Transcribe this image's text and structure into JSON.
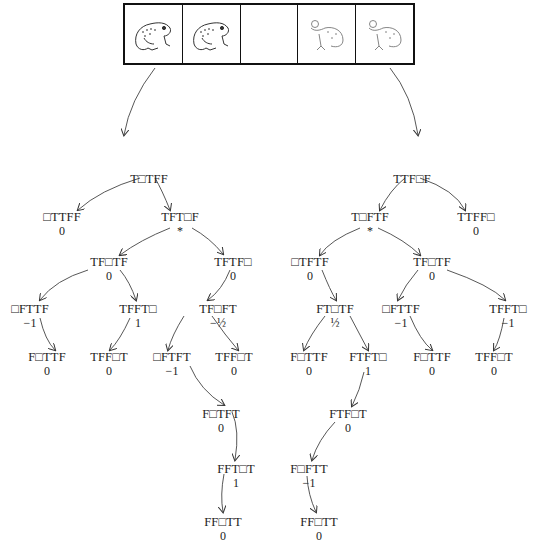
{
  "frames": {
    "cells": [
      {
        "content": "toad",
        "icon": "toad-icon"
      },
      {
        "content": "toad",
        "icon": "toad-icon"
      },
      {
        "content": "empty",
        "icon": ""
      },
      {
        "content": "frog",
        "icon": "frog-icon"
      },
      {
        "content": "frog",
        "icon": "frog-icon"
      }
    ]
  },
  "tree": {
    "nodes": {
      "n_l_root": {
        "label": "T□TFF",
        "value": ""
      },
      "n_l1": {
        "label": "□TTFF",
        "value": "0"
      },
      "n_l2": {
        "label": "TFT□F",
        "value": "*"
      },
      "n_l3": {
        "label": "TF□TF",
        "value": "0"
      },
      "n_l4": {
        "label": "TFTF□",
        "value": "0"
      },
      "n_l5": {
        "label": "□FTTF",
        "value": "−1"
      },
      "n_l6": {
        "label": "TFFT□",
        "value": "1"
      },
      "n_l7": {
        "label": "TF□FT",
        "value": "−½"
      },
      "n_l8": {
        "label": "F□TTF",
        "value": "0"
      },
      "n_l9": {
        "label": "TFF□T",
        "value": "0"
      },
      "n_l10": {
        "label": "□FTFT",
        "value": "−1"
      },
      "n_l11": {
        "label": "TFF□T",
        "value": "0"
      },
      "n_l12": {
        "label": "F□TFT",
        "value": "0"
      },
      "n_l13": {
        "label": "FFT□T",
        "value": "1"
      },
      "n_l14": {
        "label": "FF□TT",
        "value": "0"
      },
      "n_r_root": {
        "label": "TTF□F",
        "value": ""
      },
      "n_r1": {
        "label": "T□FTF",
        "value": "*"
      },
      "n_r2": {
        "label": "TTFF□",
        "value": "0"
      },
      "n_r3": {
        "label": "□TFTF",
        "value": "0"
      },
      "n_r4": {
        "label": "TF□TF",
        "value": "0"
      },
      "n_r5": {
        "label": "FT□TF",
        "value": "½"
      },
      "n_r6": {
        "label": "□FTTF",
        "value": "−1"
      },
      "n_r7": {
        "label": "TFFT□",
        "value": "−1"
      },
      "n_r8": {
        "label": "F□TTF",
        "value": "0"
      },
      "n_r9": {
        "label": "FTFT□",
        "value": "1"
      },
      "n_r10": {
        "label": "F□TTF",
        "value": "0"
      },
      "n_r11": {
        "label": "TFF□T",
        "value": "0"
      },
      "n_r12": {
        "label": "FTF□T",
        "value": "0"
      },
      "n_r13": {
        "label": "F□FTT",
        "value": "−1"
      },
      "n_r14": {
        "label": "FF□TT",
        "value": "0"
      }
    }
  },
  "colors": {
    "ink": "#222222",
    "background": "#ffffff"
  }
}
